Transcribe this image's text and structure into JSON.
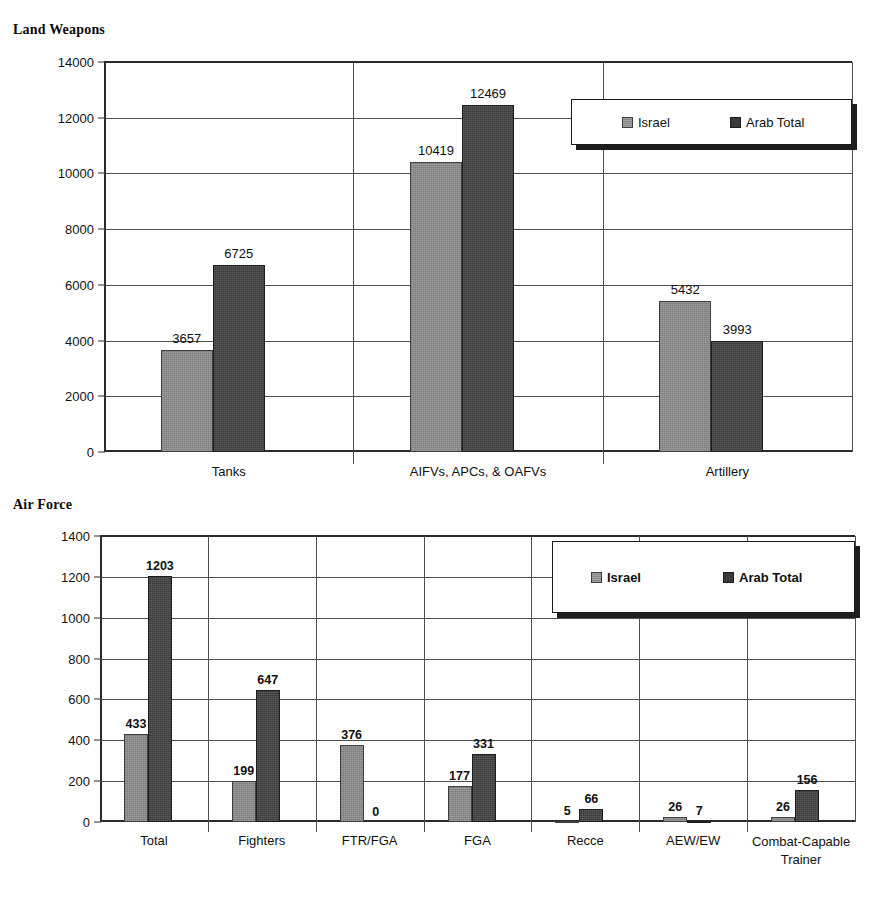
{
  "charts": [
    {
      "title": "Land Weapons",
      "legend": [
        {
          "label": "Israel",
          "color": "#8a8a8a"
        },
        {
          "label": "Arab Total",
          "color": "#3a3a3a"
        }
      ]
    },
    {
      "title": "Air Force",
      "legend": [
        {
          "label": "Israel",
          "color": "#8a8a8a"
        },
        {
          "label": "Arab Total",
          "color": "#3a3a3a"
        }
      ]
    }
  ],
  "chart_data": [
    {
      "type": "bar",
      "title": "Land Weapons",
      "xlabel": "",
      "ylabel": "",
      "ylim": [
        0,
        14000
      ],
      "yticks": [
        0,
        2000,
        4000,
        6000,
        8000,
        10000,
        12000,
        14000
      ],
      "ytick_labels": [
        "0",
        "2000",
        "4000",
        "6000",
        "8000",
        "10000",
        "12000",
        "14000"
      ],
      "grid": true,
      "legend_position": "upper right",
      "categories": [
        "Tanks",
        "AIFVs, APCs, & OAFVs",
        "Artillery"
      ],
      "series": [
        {
          "name": "Israel",
          "color": "#8a8a8a",
          "values": [
            3657,
            10419,
            5432
          ]
        },
        {
          "name": "Arab Total",
          "color": "#3a3a3a",
          "values": [
            6725,
            12469,
            3993
          ]
        }
      ]
    },
    {
      "type": "bar",
      "title": "Air Force",
      "xlabel": "",
      "ylabel": "",
      "ylim": [
        0,
        1400
      ],
      "yticks": [
        0,
        200,
        400,
        600,
        800,
        1000,
        1200,
        1400
      ],
      "ytick_labels": [
        "0",
        "200",
        "400",
        "600",
        "800",
        "1000",
        "1200",
        "1400"
      ],
      "grid": true,
      "legend_position": "upper right",
      "categories": [
        "Total",
        "Fighters",
        "FTR/FGA",
        "FGA",
        "Recce",
        "AEW/EW",
        "Combat-Capable Trainer"
      ],
      "series": [
        {
          "name": "Israel",
          "color": "#8a8a8a",
          "values": [
            433,
            199,
            376,
            177,
            5,
            26,
            26
          ]
        },
        {
          "name": "Arab Total",
          "color": "#3a3a3a",
          "values": [
            1203,
            647,
            0,
            331,
            66,
            7,
            156
          ]
        }
      ]
    }
  ]
}
